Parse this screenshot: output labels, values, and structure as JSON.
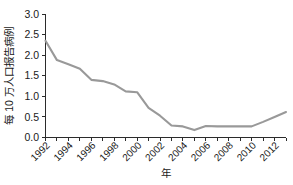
{
  "chart_data": {
    "type": "line",
    "title": "",
    "xlabel": "年",
    "ylabel": "每 10 万人口报告病例",
    "x": [
      1992,
      1993,
      1994,
      1995,
      1996,
      1997,
      1998,
      1999,
      2000,
      2001,
      2002,
      2003,
      2004,
      2005,
      2006,
      2007,
      2008,
      2009,
      2010,
      2011,
      2012,
      2013
    ],
    "values": [
      2.35,
      1.88,
      1.78,
      1.67,
      1.4,
      1.37,
      1.29,
      1.12,
      1.1,
      0.72,
      0.53,
      0.29,
      0.27,
      0.18,
      0.28,
      0.27,
      0.27,
      0.27,
      0.27,
      0.38,
      0.5,
      0.62
    ],
    "series": [
      {
        "name": "每 10 万人口报告病例",
        "values": [
          2.35,
          1.88,
          1.78,
          1.67,
          1.4,
          1.37,
          1.29,
          1.12,
          1.1,
          0.72,
          0.53,
          0.29,
          0.27,
          0.18,
          0.28,
          0.27,
          0.27,
          0.27,
          0.27,
          0.38,
          0.5,
          0.62
        ]
      }
    ],
    "xlim": [
      1992,
      2013
    ],
    "ylim": [
      0.0,
      3.0
    ],
    "ytick_labels": [
      "3.0",
      "2.5",
      "2.0",
      "1.5",
      "1.0",
      "0.5",
      "0.0"
    ],
    "ytick_values": [
      3.0,
      2.5,
      2.0,
      1.5,
      1.0,
      0.5,
      0.0
    ],
    "xtick_labels": [
      "1992",
      "1994",
      "1996",
      "1998",
      "2000",
      "2002",
      "2004",
      "2006",
      "2008",
      "2010",
      "2012"
    ],
    "xtick_values": [
      1992,
      1994,
      1996,
      1998,
      2000,
      2002,
      2004,
      2006,
      2008,
      2010,
      2012
    ],
    "grid": false,
    "legend": false,
    "legend_position": "none",
    "line_color": "#999999",
    "axis_color": "#2b2b2b",
    "background_color": "#ffffff"
  }
}
